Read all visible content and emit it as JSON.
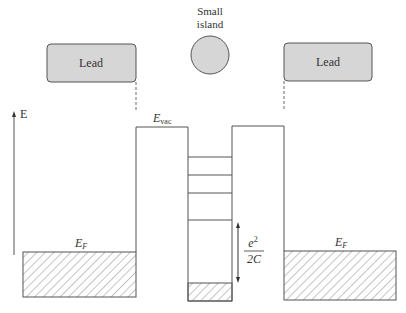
{
  "diagram": {
    "island_label_line1": "Small",
    "island_label_line2": "island",
    "left_lead_label": "Lead",
    "right_lead_label": "Lead",
    "energy_axis_label": "E",
    "vacuum_level_label": "E",
    "vacuum_level_subscript": "vac",
    "left_fermi_label": "E",
    "left_fermi_subscript": "F",
    "right_fermi_label": "E",
    "right_fermi_subscript": "F",
    "charging_energy_numerator": "e",
    "charging_energy_numerator_sup": "2",
    "charging_energy_denominator": "2C",
    "island_level_count": 4,
    "colors": {
      "lead_fill": "#d6d6d6",
      "line": "#555555",
      "hatch": "#888888"
    }
  }
}
